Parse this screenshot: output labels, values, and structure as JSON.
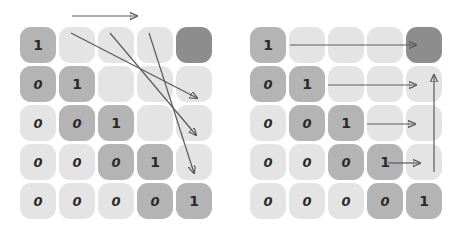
{
  "figure": {
    "title": "",
    "cell_colors": {
      "light": "#e4e4e4",
      "mid": "#b4b4b4",
      "dark": "#8d8d8d",
      "arrow": "#5a5a5a",
      "digit": "#2a2a2a",
      "background": "#ffffff"
    }
  },
  "panels": [
    {
      "id": "left",
      "name": "left-matrix-panel",
      "arrow_pattern": "diagonal",
      "grid": {
        "rows": 5,
        "cols": 5,
        "cells": [
          [
            {
              "value": "1",
              "shade": "mid"
            },
            {
              "value": "",
              "shade": "light"
            },
            {
              "value": "",
              "shade": "light"
            },
            {
              "value": "",
              "shade": "light"
            },
            {
              "value": "",
              "shade": "dark"
            }
          ],
          [
            {
              "value": "0",
              "shade": "mid"
            },
            {
              "value": "1",
              "shade": "mid"
            },
            {
              "value": "",
              "shade": "light"
            },
            {
              "value": "",
              "shade": "light"
            },
            {
              "value": "",
              "shade": "light"
            }
          ],
          [
            {
              "value": "0",
              "shade": "light"
            },
            {
              "value": "0",
              "shade": "mid"
            },
            {
              "value": "1",
              "shade": "mid"
            },
            {
              "value": "",
              "shade": "light"
            },
            {
              "value": "",
              "shade": "light"
            }
          ],
          [
            {
              "value": "0",
              "shade": "light"
            },
            {
              "value": "0",
              "shade": "light"
            },
            {
              "value": "0",
              "shade": "mid"
            },
            {
              "value": "1",
              "shade": "mid"
            },
            {
              "value": "",
              "shade": "light"
            }
          ],
          [
            {
              "value": "0",
              "shade": "light"
            },
            {
              "value": "0",
              "shade": "light"
            },
            {
              "value": "0",
              "shade": "light"
            },
            {
              "value": "0",
              "shade": "mid"
            },
            {
              "value": "1",
              "shade": "mid"
            }
          ]
        ]
      },
      "arrows": [
        {
          "name": "top-horizontal-arrow",
          "x1": 72,
          "y1": 16,
          "x2": 137,
          "y2": 16
        },
        {
          "name": "diagonal-arrow-1",
          "x1": 71,
          "y1": 33,
          "x2": 197,
          "y2": 98
        },
        {
          "name": "diagonal-arrow-2",
          "x1": 110,
          "y1": 33,
          "x2": 196,
          "y2": 135
        },
        {
          "name": "diagonal-arrow-3",
          "x1": 149,
          "y1": 33,
          "x2": 194,
          "y2": 173
        }
      ]
    },
    {
      "id": "right",
      "name": "right-matrix-panel",
      "arrow_pattern": "row-wise",
      "grid": {
        "rows": 5,
        "cols": 5,
        "cells": [
          [
            {
              "value": "1",
              "shade": "mid"
            },
            {
              "value": "",
              "shade": "light"
            },
            {
              "value": "",
              "shade": "light"
            },
            {
              "value": "",
              "shade": "light"
            },
            {
              "value": "",
              "shade": "dark"
            }
          ],
          [
            {
              "value": "0",
              "shade": "mid"
            },
            {
              "value": "1",
              "shade": "mid"
            },
            {
              "value": "",
              "shade": "light"
            },
            {
              "value": "",
              "shade": "light"
            },
            {
              "value": "",
              "shade": "light"
            }
          ],
          [
            {
              "value": "0",
              "shade": "light"
            },
            {
              "value": "0",
              "shade": "mid"
            },
            {
              "value": "1",
              "shade": "mid"
            },
            {
              "value": "",
              "shade": "light"
            },
            {
              "value": "",
              "shade": "light"
            }
          ],
          [
            {
              "value": "0",
              "shade": "light"
            },
            {
              "value": "0",
              "shade": "light"
            },
            {
              "value": "0",
              "shade": "mid"
            },
            {
              "value": "1",
              "shade": "mid"
            },
            {
              "value": "",
              "shade": "light"
            }
          ],
          [
            {
              "value": "0",
              "shade": "light"
            },
            {
              "value": "0",
              "shade": "light"
            },
            {
              "value": "0",
              "shade": "light"
            },
            {
              "value": "0",
              "shade": "mid"
            },
            {
              "value": "1",
              "shade": "mid"
            }
          ]
        ]
      },
      "arrows": [
        {
          "name": "row-arrow-1",
          "x1": 60,
          "y1": 45,
          "x2": 186,
          "y2": 45
        },
        {
          "name": "row-arrow-2",
          "x1": 98,
          "y1": 85,
          "x2": 186,
          "y2": 85
        },
        {
          "name": "row-arrow-3",
          "x1": 137,
          "y1": 124,
          "x2": 185,
          "y2": 124
        },
        {
          "name": "row-arrow-4",
          "x1": 158,
          "y1": 163,
          "x2": 190,
          "y2": 163
        },
        {
          "name": "vertical-up-arrow",
          "x1": 204,
          "y1": 172,
          "x2": 204,
          "y2": 75
        }
      ]
    }
  ]
}
